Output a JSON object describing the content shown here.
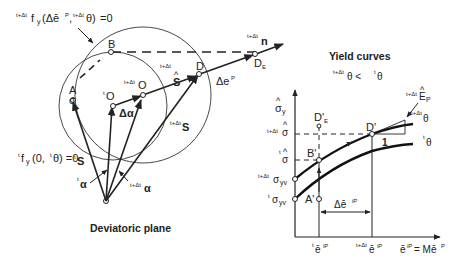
{
  "left_panel": {
    "caption": "Deviatoric plane",
    "outer_yield_label": {
      "pre": "t+Δt",
      "f": "f",
      "sub": "y",
      "args": "(Δē",
      "p": "P",
      "comma": ",",
      "pre2": "t+Δt",
      "theta": "θ)",
      "eq": " =0"
    },
    "inner_yield_label": {
      "pre": "t",
      "f": "f",
      "sub": "y",
      "args": "(0,",
      "pre2": "t",
      "theta": "θ) =0"
    },
    "points": {
      "A": "A",
      "sigma_hat": "σ",
      "B": "B",
      "O_t": {
        "pre": "t",
        "label": "O"
      },
      "O_tdt": {
        "pre": "t+Δt",
        "label": "O"
      },
      "D": "D",
      "DE": {
        "label": "D",
        "sub": "E"
      }
    },
    "vectors": {
      "delta_alpha": "Δα",
      "s_hat": {
        "pre": "t+Δt",
        "label": "S"
      },
      "s_tdt": {
        "pre": "t+Δt",
        "label": "S"
      },
      "s_t": {
        "pre": "t",
        "label": "S"
      },
      "alpha_t": {
        "pre": "t",
        "label": "α"
      },
      "alpha_tdt": {
        "pre": "t+Δt",
        "label": "α"
      },
      "delta_ep": {
        "label": "Δe",
        "sup": "P"
      },
      "n": {
        "pre": "t+Δt",
        "label": "n"
      }
    }
  },
  "right_panel": {
    "title": "Yield curves",
    "condition": {
      "pre1": "t+Δt",
      "theta1": "θ < ",
      "pre2": "t",
      "theta2": "θ"
    },
    "y_axis_label": {
      "label": "σ",
      "sub": "y"
    },
    "y_ticks": [
      {
        "pre": "t+Δt",
        "label": "σ",
        "hat": true
      },
      {
        "pre": "t",
        "label": "σ",
        "hat": true
      },
      {
        "pre": "t+Δt",
        "label": "σ",
        "sub": "yv"
      },
      {
        "pre": "t",
        "label": "σ",
        "sub": "yv"
      }
    ],
    "x_ticks": [
      {
        "pre": "t",
        "label": "ē",
        "sup": "iP"
      },
      {
        "pre": "t+Δt",
        "label": "ē",
        "sup": "iP"
      }
    ],
    "x_axis_label": {
      "label": "ē",
      "sup": "iP",
      "eq": "= Mē",
      "sup2": "P"
    },
    "points": {
      "A_prime": "A'",
      "B_prime": "B'",
      "D_prime": "D'",
      "DE_prime": {
        "label": "D'",
        "sub": "E"
      }
    },
    "delta_label": {
      "label": "Δē",
      "sup": "iP"
    },
    "slope_label": "1",
    "tangent_label": {
      "pre": "t+Δt",
      "label": "E",
      "sub": "P",
      "hat": true
    },
    "curves": [
      {
        "pre": "t+Δt",
        "label": "θ"
      },
      {
        "pre": "t",
        "label": "θ"
      }
    ]
  }
}
